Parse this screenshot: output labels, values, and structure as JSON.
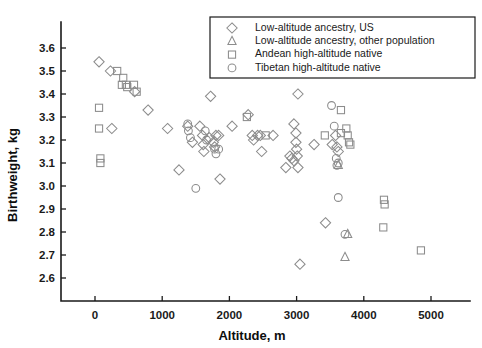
{
  "chart_data": {
    "type": "scatter",
    "title": "",
    "xlabel": "Altitude, m",
    "ylabel": "Birthweight, kg",
    "xlim": [
      -250,
      5500
    ],
    "ylim": [
      2.55,
      3.65
    ],
    "xticks": [
      0,
      1000,
      2000,
      3000,
      4000,
      5000
    ],
    "xtick_labels": [
      "0",
      "1000",
      "2000",
      "3000",
      "4000",
      "5000"
    ],
    "yticks": [
      2.6,
      2.7,
      2.8,
      2.9,
      3.0,
      3.1,
      3.2,
      3.3,
      3.4,
      3.5,
      3.6
    ],
    "ytick_labels": [
      "2.6",
      "2.7",
      "2.8",
      "2.9",
      "3.0",
      "3.1",
      "3.2",
      "3.3",
      "3.4",
      "3.5",
      "3.6"
    ],
    "grid": false,
    "legend_position": "top-right",
    "marker_color": "#8c8c8c",
    "axis_color": "#1a1a1a",
    "series": [
      {
        "name": "Low-altitude ancestry, US",
        "marker": "diamond",
        "points": [
          [
            60,
            3.54
          ],
          [
            230,
            3.5
          ],
          [
            590,
            3.41
          ],
          [
            790,
            3.33
          ],
          [
            250,
            3.25
          ],
          [
            1080,
            3.25
          ],
          [
            1250,
            3.07
          ],
          [
            1380,
            3.26
          ],
          [
            1450,
            3.19
          ],
          [
            1560,
            3.26
          ],
          [
            1600,
            3.22
          ],
          [
            1610,
            3.18
          ],
          [
            1620,
            3.15
          ],
          [
            1720,
            3.39
          ],
          [
            1700,
            3.21
          ],
          [
            1760,
            3.19
          ],
          [
            1780,
            3.17
          ],
          [
            1800,
            3.22
          ],
          [
            1840,
            3.22
          ],
          [
            1860,
            3.03
          ],
          [
            2040,
            3.26
          ],
          [
            2280,
            3.31
          ],
          [
            2340,
            3.22
          ],
          [
            2360,
            3.2
          ],
          [
            2420,
            3.22
          ],
          [
            2460,
            3.22
          ],
          [
            2480,
            3.15
          ],
          [
            2650,
            3.22
          ],
          [
            2960,
            3.27
          ],
          [
            2990,
            3.23
          ],
          [
            2990,
            3.19
          ],
          [
            3000,
            3.16
          ],
          [
            3010,
            3.13
          ],
          [
            3020,
            3.4
          ],
          [
            2900,
            3.13
          ],
          [
            2930,
            3.12
          ],
          [
            2960,
            3.11
          ],
          [
            2840,
            3.08
          ],
          [
            3020,
            3.08
          ],
          [
            3050,
            2.66
          ],
          [
            3430,
            2.84
          ],
          [
            3530,
            3.18
          ],
          [
            3580,
            3.22
          ],
          [
            3600,
            3.17
          ],
          [
            3620,
            3.15
          ],
          [
            3260,
            3.18
          ]
        ]
      },
      {
        "name": "Low-altitude ancestry, other population",
        "marker": "triangle",
        "points": [
          [
            3760,
            2.79
          ],
          [
            3720,
            2.69
          ],
          [
            3620,
            3.09
          ]
        ]
      },
      {
        "name": "Andean high-altitude native",
        "marker": "square",
        "points": [
          [
            330,
            3.5
          ],
          [
            420,
            3.47
          ],
          [
            400,
            3.44
          ],
          [
            460,
            3.44
          ],
          [
            480,
            3.43
          ],
          [
            580,
            3.44
          ],
          [
            620,
            3.41
          ],
          [
            60,
            3.34
          ],
          [
            60,
            3.25
          ],
          [
            80,
            3.12
          ],
          [
            80,
            3.1
          ],
          [
            2260,
            3.3
          ],
          [
            2540,
            3.22
          ],
          [
            3420,
            3.22
          ],
          [
            3660,
            3.33
          ],
          [
            3740,
            3.25
          ],
          [
            3660,
            3.23
          ],
          [
            3760,
            3.22
          ],
          [
            3780,
            3.19
          ],
          [
            3800,
            3.18
          ],
          [
            4300,
            2.94
          ],
          [
            4310,
            2.92
          ],
          [
            4290,
            2.82
          ],
          [
            4850,
            2.72
          ]
        ]
      },
      {
        "name": "Tibetan high-altitude native",
        "marker": "circle",
        "points": [
          [
            1380,
            3.27
          ],
          [
            1390,
            3.24
          ],
          [
            1420,
            3.21
          ],
          [
            1640,
            3.24
          ],
          [
            1660,
            3.2
          ],
          [
            1780,
            3.16
          ],
          [
            1800,
            3.14
          ],
          [
            1840,
            3.16
          ],
          [
            1500,
            2.99
          ],
          [
            3520,
            3.35
          ],
          [
            3560,
            3.26
          ],
          [
            3590,
            3.12
          ],
          [
            3600,
            3.09
          ],
          [
            3620,
            3.1
          ],
          [
            3620,
            2.95
          ],
          [
            3720,
            2.79
          ]
        ]
      }
    ]
  },
  "legend": {
    "entries": [
      {
        "label": "Low-altitude ancestry, US",
        "marker": "diamond"
      },
      {
        "label": "Low-altitude ancestry, other population",
        "marker": "triangle"
      },
      {
        "label": "Andean high-altitude native",
        "marker": "square"
      },
      {
        "label": "Tibetan high-altitude native",
        "marker": "circle"
      }
    ]
  }
}
